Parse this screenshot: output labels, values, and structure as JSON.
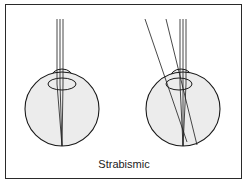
{
  "caption": "Strabismic",
  "colors": {
    "eye_fill": "#ececec",
    "stroke": "#1a1a1a",
    "frame": "#2a2a2a",
    "background": "#ffffff"
  },
  "eyes": [
    {
      "name": "left-eye",
      "description": "aligned eye, parallel rays focus on retina"
    },
    {
      "name": "right-eye",
      "description": "strabismic eye, parallel and oblique rays"
    }
  ]
}
